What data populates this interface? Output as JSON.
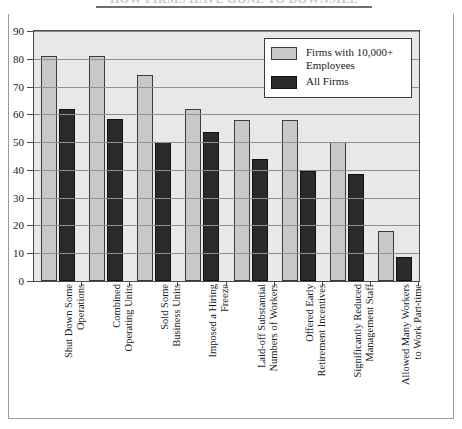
{
  "page": {
    "title_partial": "HOW FIRMS HAVE GONE TO DOWNSIZE"
  },
  "legend": {
    "position": "top-right",
    "entries": [
      {
        "label": "Firms with 10,000+ Employees",
        "color": "#c8c8c6",
        "swatch": "light-swatch"
      },
      {
        "label": "All Firms",
        "color": "#2b2b2b",
        "swatch": "dark-swatch"
      }
    ]
  },
  "axis": {
    "y_ticks": [
      "90",
      "80",
      "70",
      "60",
      "50",
      "40",
      "30",
      "20",
      "10",
      "0"
    ]
  },
  "chart_data": {
    "type": "bar",
    "title": "HOW FIRMS HAVE GONE TO DOWNSIZE",
    "xlabel": "",
    "ylabel": "",
    "ylim": [
      0,
      90
    ],
    "ytick_step": 10,
    "grid": true,
    "legend_position": "top-right",
    "categories": [
      "Shut Down Some\nOperations",
      "Combined\nOperating Units",
      "Sold Some\nBusiness Units",
      "Imposed a Hiring\nFreeze",
      "Laid-off Substantial\nNumbers of Workers",
      "Offered Early\nRetirement Incentives",
      "Significantly Reduced\nManagement Staff",
      "Allowed Many Workers\nto Work Part-time"
    ],
    "series": [
      {
        "name": "Firms with 10,000+ Employees",
        "color": "#c8c8c6",
        "values": [
          81,
          81,
          74,
          62,
          58,
          58,
          50,
          18
        ]
      },
      {
        "name": "All Firms",
        "color": "#2b2b2b",
        "values": [
          62,
          58.5,
          50,
          53.5,
          44,
          39.5,
          38.5,
          8.5
        ]
      }
    ]
  }
}
